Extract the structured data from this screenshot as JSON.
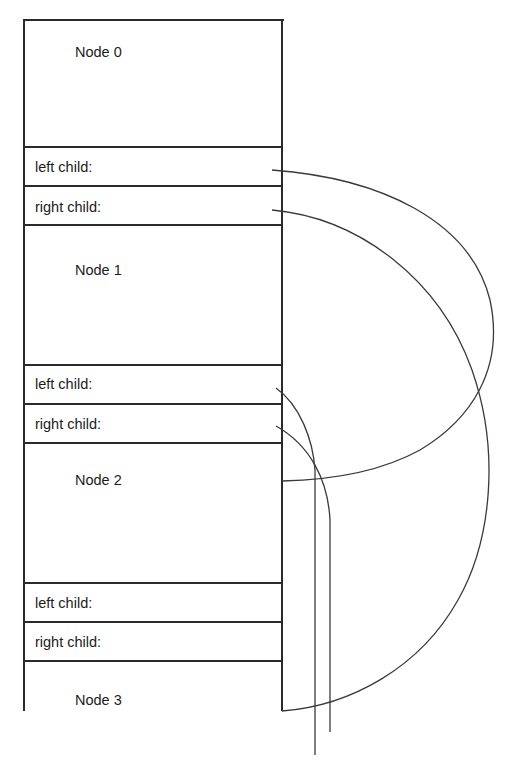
{
  "diagram": {
    "type": "memory-layout-binary-tree",
    "nodes": [
      {
        "id": 0,
        "title": "Node 0",
        "fields": {
          "left": "left child:",
          "right": "right child:"
        }
      },
      {
        "id": 1,
        "title": "Node 1",
        "fields": {
          "left": "left child:",
          "right": "right child:"
        }
      },
      {
        "id": 2,
        "title": "Node 2",
        "fields": {
          "left": "left child:",
          "right": "right child:"
        }
      },
      {
        "id": 3,
        "title": "Node 3"
      }
    ],
    "edges": [
      {
        "from": "Node 0.left child",
        "to": "Node 2"
      },
      {
        "from": "Node 0.right child",
        "to": "Node 3"
      },
      {
        "from": "Node 1.left child",
        "to": "off-diagram (below)"
      },
      {
        "from": "Node 1.right child",
        "to": "off-diagram (below)"
      }
    ],
    "colors": {
      "line": "#2a2a2a",
      "text": "#1c1c1c",
      "background": "#ffffff"
    }
  }
}
